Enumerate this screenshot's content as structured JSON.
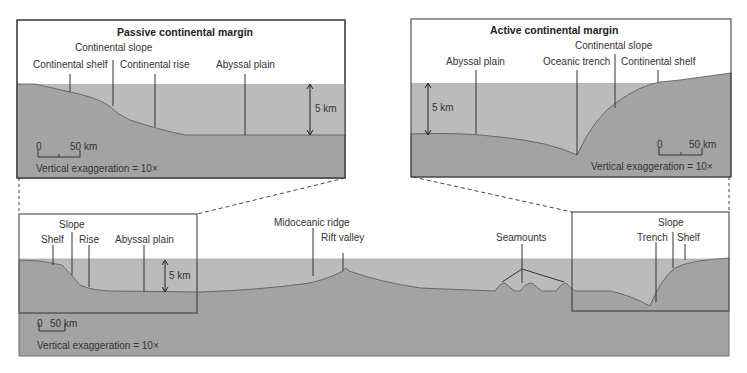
{
  "colors": {
    "water": "#b9b9b9",
    "rock": "#a4a4a4",
    "frame": "#333333",
    "background": "#ffffff"
  },
  "passive_panel": {
    "title": "Passive continental margin",
    "labels": {
      "shelf": "Continental shelf",
      "slope": "Continental slope",
      "rise": "Continental rise",
      "plain": "Abyssal plain"
    },
    "depth": "5 km",
    "scale_zero": "0",
    "scale_dist": "50 km",
    "exaggeration": "Vertical exaggeration = 10×"
  },
  "active_panel": {
    "title": "Active continental margin",
    "labels": {
      "plain": "Abyssal plain",
      "trench": "Oceanic trench",
      "slope": "Continental slope",
      "shelf": "Continental shelf"
    },
    "depth": "5 km",
    "scale_zero": "0",
    "scale_dist": "50 km",
    "exaggeration": "Vertical exaggeration = 10×"
  },
  "ocean_profile": {
    "labels": {
      "shelf": "Shelf",
      "slope": "Slope",
      "rise": "Rise",
      "plain": "Abyssal plain",
      "ridge": "Midoceanic ridge",
      "rift": "Rift valley",
      "seamounts": "Seamounts",
      "trench": "Trench",
      "slope_r": "Slope",
      "shelf_r": "Shelf"
    },
    "depth": "5 km",
    "scale_zero": "0",
    "scale_dist": "50 km",
    "exaggeration": "Vertical exaggeration = 10×"
  }
}
